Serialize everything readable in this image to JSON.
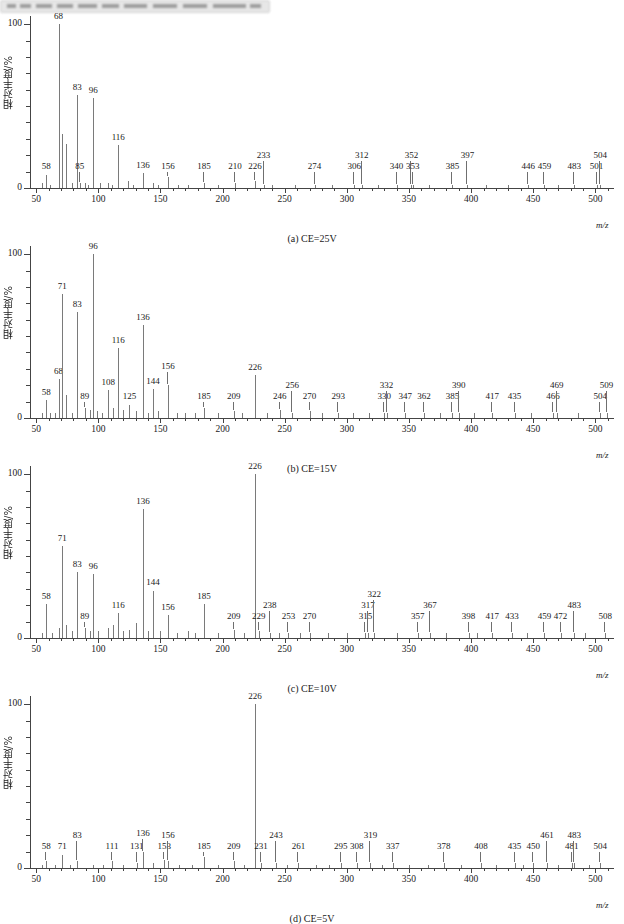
{
  "window": {
    "title_blurred": true
  },
  "figure": {
    "y_axis_title": "相对丰度/%",
    "x_axis_title": "m/z",
    "y_ticks": [
      0,
      100
    ],
    "x_ticks": [
      50,
      100,
      150,
      200,
      250,
      300,
      350,
      400,
      450,
      500
    ],
    "x_range": [
      45,
      515
    ],
    "y_range": [
      0,
      105
    ],
    "series_color": "#7a7a7a"
  },
  "chart_data": [
    {
      "type": "bar",
      "panel": "a",
      "title": "(a) CE=25V",
      "xlabel": "m/z",
      "ylabel": "相对丰度/%",
      "xlim": [
        45,
        515
      ],
      "ylim": [
        0,
        105
      ],
      "grid": false,
      "labeled_peaks": [
        {
          "mz": 58,
          "intensity": 8
        },
        {
          "mz": 68,
          "intensity": 100
        },
        {
          "mz": 83,
          "intensity": 57
        },
        {
          "mz": 85,
          "intensity": 3
        },
        {
          "mz": 96,
          "intensity": 55
        },
        {
          "mz": 116,
          "intensity": 26
        },
        {
          "mz": 136,
          "intensity": 9
        },
        {
          "mz": 156,
          "intensity": 7
        },
        {
          "mz": 185,
          "intensity": 3
        },
        {
          "mz": 210,
          "intensity": 3
        },
        {
          "mz": 226,
          "intensity": 4
        },
        {
          "mz": 233,
          "intensity": 2
        },
        {
          "mz": 274,
          "intensity": 2
        },
        {
          "mz": 306,
          "intensity": 2
        },
        {
          "mz": 312,
          "intensity": 2
        },
        {
          "mz": 340,
          "intensity": 2
        },
        {
          "mz": 352,
          "intensity": 2
        },
        {
          "mz": 353,
          "intensity": 2
        },
        {
          "mz": 385,
          "intensity": 2
        },
        {
          "mz": 397,
          "intensity": 2
        },
        {
          "mz": 446,
          "intensity": 2
        },
        {
          "mz": 459,
          "intensity": 2
        },
        {
          "mz": 483,
          "intensity": 2
        },
        {
          "mz": 501,
          "intensity": 2
        },
        {
          "mz": 504,
          "intensity": 2
        }
      ],
      "unlabeled_peaks": [
        {
          "mz": 71,
          "intensity": 33
        },
        {
          "mz": 74,
          "intensity": 27
        },
        {
          "mz": 55,
          "intensity": 3
        },
        {
          "mz": 61,
          "intensity": 2
        },
        {
          "mz": 79,
          "intensity": 3
        },
        {
          "mz": 89,
          "intensity": 3
        },
        {
          "mz": 92,
          "intensity": 2
        },
        {
          "mz": 101,
          "intensity": 3
        },
        {
          "mz": 108,
          "intensity": 3
        },
        {
          "mz": 111,
          "intensity": 2
        },
        {
          "mz": 124,
          "intensity": 4
        },
        {
          "mz": 128,
          "intensity": 2
        },
        {
          "mz": 144,
          "intensity": 3
        },
        {
          "mz": 148,
          "intensity": 2
        },
        {
          "mz": 164,
          "intensity": 2
        },
        {
          "mz": 172,
          "intensity": 2
        },
        {
          "mz": 196,
          "intensity": 2
        },
        {
          "mz": 240,
          "intensity": 2
        },
        {
          "mz": 258,
          "intensity": 2
        },
        {
          "mz": 288,
          "intensity": 2
        },
        {
          "mz": 325,
          "intensity": 2
        },
        {
          "mz": 366,
          "intensity": 2
        },
        {
          "mz": 412,
          "intensity": 2
        },
        {
          "mz": 430,
          "intensity": 2
        },
        {
          "mz": 470,
          "intensity": 2
        }
      ]
    },
    {
      "type": "bar",
      "panel": "b",
      "title": "(b) CE=15V",
      "xlabel": "m/z",
      "ylabel": "相对丰度/%",
      "xlim": [
        45,
        515
      ],
      "ylim": [
        0,
        105
      ],
      "grid": false,
      "labeled_peaks": [
        {
          "mz": 58,
          "intensity": 11
        },
        {
          "mz": 68,
          "intensity": 24
        },
        {
          "mz": 71,
          "intensity": 76
        },
        {
          "mz": 83,
          "intensity": 65
        },
        {
          "mz": 89,
          "intensity": 6
        },
        {
          "mz": 96,
          "intensity": 100
        },
        {
          "mz": 108,
          "intensity": 17
        },
        {
          "mz": 116,
          "intensity": 43
        },
        {
          "mz": 125,
          "intensity": 8
        },
        {
          "mz": 136,
          "intensity": 57
        },
        {
          "mz": 144,
          "intensity": 18
        },
        {
          "mz": 156,
          "intensity": 20
        },
        {
          "mz": 185,
          "intensity": 6
        },
        {
          "mz": 209,
          "intensity": 4
        },
        {
          "mz": 226,
          "intensity": 26
        },
        {
          "mz": 246,
          "intensity": 5
        },
        {
          "mz": 256,
          "intensity": 3
        },
        {
          "mz": 270,
          "intensity": 4
        },
        {
          "mz": 293,
          "intensity": 3
        },
        {
          "mz": 330,
          "intensity": 3
        },
        {
          "mz": 332,
          "intensity": 3
        },
        {
          "mz": 347,
          "intensity": 3
        },
        {
          "mz": 362,
          "intensity": 3
        },
        {
          "mz": 385,
          "intensity": 3
        },
        {
          "mz": 390,
          "intensity": 3
        },
        {
          "mz": 417,
          "intensity": 3
        },
        {
          "mz": 435,
          "intensity": 3
        },
        {
          "mz": 466,
          "intensity": 3
        },
        {
          "mz": 469,
          "intensity": 3
        },
        {
          "mz": 504,
          "intensity": 3
        },
        {
          "mz": 509,
          "intensity": 3
        }
      ],
      "unlabeled_peaks": [
        {
          "mz": 55,
          "intensity": 3
        },
        {
          "mz": 61,
          "intensity": 3
        },
        {
          "mz": 65,
          "intensity": 3
        },
        {
          "mz": 74,
          "intensity": 14
        },
        {
          "mz": 79,
          "intensity": 3
        },
        {
          "mz": 93,
          "intensity": 5
        },
        {
          "mz": 99,
          "intensity": 4
        },
        {
          "mz": 103,
          "intensity": 3
        },
        {
          "mz": 112,
          "intensity": 6
        },
        {
          "mz": 120,
          "intensity": 5
        },
        {
          "mz": 130,
          "intensity": 4
        },
        {
          "mz": 140,
          "intensity": 3
        },
        {
          "mz": 148,
          "intensity": 4
        },
        {
          "mz": 163,
          "intensity": 3
        },
        {
          "mz": 170,
          "intensity": 3
        },
        {
          "mz": 178,
          "intensity": 3
        },
        {
          "mz": 196,
          "intensity": 3
        },
        {
          "mz": 216,
          "intensity": 3
        },
        {
          "mz": 236,
          "intensity": 3
        },
        {
          "mz": 280,
          "intensity": 3
        },
        {
          "mz": 305,
          "intensity": 3
        },
        {
          "mz": 318,
          "intensity": 3
        },
        {
          "mz": 375,
          "intensity": 3
        },
        {
          "mz": 402,
          "intensity": 3
        },
        {
          "mz": 448,
          "intensity": 3
        },
        {
          "mz": 486,
          "intensity": 3
        }
      ]
    },
    {
      "type": "bar",
      "panel": "c",
      "title": "(c) CE=10V",
      "xlabel": "m/z",
      "ylabel": "相对丰度/%",
      "xlim": [
        45,
        515
      ],
      "ylim": [
        0,
        105
      ],
      "grid": false,
      "labeled_peaks": [
        {
          "mz": 58,
          "intensity": 21
        },
        {
          "mz": 71,
          "intensity": 56
        },
        {
          "mz": 83,
          "intensity": 40
        },
        {
          "mz": 89,
          "intensity": 6
        },
        {
          "mz": 96,
          "intensity": 39
        },
        {
          "mz": 116,
          "intensity": 15
        },
        {
          "mz": 136,
          "intensity": 79
        },
        {
          "mz": 144,
          "intensity": 29
        },
        {
          "mz": 156,
          "intensity": 14
        },
        {
          "mz": 185,
          "intensity": 21
        },
        {
          "mz": 209,
          "intensity": 5
        },
        {
          "mz": 226,
          "intensity": 100
        },
        {
          "mz": 229,
          "intensity": 4
        },
        {
          "mz": 238,
          "intensity": 3
        },
        {
          "mz": 253,
          "intensity": 3
        },
        {
          "mz": 270,
          "intensity": 3
        },
        {
          "mz": 315,
          "intensity": 3
        },
        {
          "mz": 317,
          "intensity": 3
        },
        {
          "mz": 322,
          "intensity": 3
        },
        {
          "mz": 357,
          "intensity": 3
        },
        {
          "mz": 367,
          "intensity": 3
        },
        {
          "mz": 398,
          "intensity": 3
        },
        {
          "mz": 417,
          "intensity": 3
        },
        {
          "mz": 433,
          "intensity": 3
        },
        {
          "mz": 459,
          "intensity": 3
        },
        {
          "mz": 472,
          "intensity": 3
        },
        {
          "mz": 483,
          "intensity": 3
        },
        {
          "mz": 508,
          "intensity": 3
        }
      ],
      "unlabeled_peaks": [
        {
          "mz": 55,
          "intensity": 3
        },
        {
          "mz": 63,
          "intensity": 3
        },
        {
          "mz": 68,
          "intensity": 6
        },
        {
          "mz": 74,
          "intensity": 8
        },
        {
          "mz": 79,
          "intensity": 4
        },
        {
          "mz": 93,
          "intensity": 4
        },
        {
          "mz": 100,
          "intensity": 4
        },
        {
          "mz": 108,
          "intensity": 6
        },
        {
          "mz": 112,
          "intensity": 8
        },
        {
          "mz": 120,
          "intensity": 4
        },
        {
          "mz": 125,
          "intensity": 5
        },
        {
          "mz": 130,
          "intensity": 9
        },
        {
          "mz": 140,
          "intensity": 4
        },
        {
          "mz": 150,
          "intensity": 4
        },
        {
          "mz": 163,
          "intensity": 3
        },
        {
          "mz": 172,
          "intensity": 4
        },
        {
          "mz": 178,
          "intensity": 3
        },
        {
          "mz": 196,
          "intensity": 3
        },
        {
          "mz": 217,
          "intensity": 3
        },
        {
          "mz": 245,
          "intensity": 3
        },
        {
          "mz": 262,
          "intensity": 3
        },
        {
          "mz": 285,
          "intensity": 3
        },
        {
          "mz": 300,
          "intensity": 3
        },
        {
          "mz": 340,
          "intensity": 3
        },
        {
          "mz": 380,
          "intensity": 3
        },
        {
          "mz": 405,
          "intensity": 3
        },
        {
          "mz": 445,
          "intensity": 3
        },
        {
          "mz": 492,
          "intensity": 3
        }
      ]
    },
    {
      "type": "bar",
      "panel": "d",
      "title": "(d) CE=5V",
      "xlabel": "m/z",
      "ylabel": "相对丰度/%",
      "xlim": [
        45,
        515
      ],
      "ylim": [
        0,
        105
      ],
      "grid": false,
      "labeled_peaks": [
        {
          "mz": 58,
          "intensity": 4
        },
        {
          "mz": 71,
          "intensity": 8
        },
        {
          "mz": 83,
          "intensity": 4
        },
        {
          "mz": 111,
          "intensity": 4
        },
        {
          "mz": 131,
          "intensity": 3
        },
        {
          "mz": 136,
          "intensity": 10
        },
        {
          "mz": 153,
          "intensity": 5
        },
        {
          "mz": 156,
          "intensity": 4
        },
        {
          "mz": 185,
          "intensity": 7
        },
        {
          "mz": 209,
          "intensity": 4
        },
        {
          "mz": 226,
          "intensity": 100
        },
        {
          "mz": 231,
          "intensity": 3
        },
        {
          "mz": 243,
          "intensity": 3
        },
        {
          "mz": 261,
          "intensity": 3
        },
        {
          "mz": 295,
          "intensity": 3
        },
        {
          "mz": 308,
          "intensity": 3
        },
        {
          "mz": 319,
          "intensity": 3
        },
        {
          "mz": 337,
          "intensity": 3
        },
        {
          "mz": 378,
          "intensity": 3
        },
        {
          "mz": 408,
          "intensity": 3
        },
        {
          "mz": 435,
          "intensity": 3
        },
        {
          "mz": 450,
          "intensity": 3
        },
        {
          "mz": 461,
          "intensity": 3
        },
        {
          "mz": 481,
          "intensity": 3
        },
        {
          "mz": 483,
          "intensity": 3
        },
        {
          "mz": 504,
          "intensity": 3
        }
      ],
      "unlabeled_peaks": [
        {
          "mz": 55,
          "intensity": 2
        },
        {
          "mz": 65,
          "intensity": 2
        },
        {
          "mz": 77,
          "intensity": 2
        },
        {
          "mz": 96,
          "intensity": 2
        },
        {
          "mz": 104,
          "intensity": 2
        },
        {
          "mz": 120,
          "intensity": 2
        },
        {
          "mz": 144,
          "intensity": 3
        },
        {
          "mz": 165,
          "intensity": 2
        },
        {
          "mz": 175,
          "intensity": 2
        },
        {
          "mz": 196,
          "intensity": 2
        },
        {
          "mz": 217,
          "intensity": 2
        },
        {
          "mz": 252,
          "intensity": 2
        },
        {
          "mz": 275,
          "intensity": 2
        },
        {
          "mz": 286,
          "intensity": 2
        },
        {
          "mz": 328,
          "intensity": 2
        },
        {
          "mz": 350,
          "intensity": 2
        },
        {
          "mz": 365,
          "intensity": 2
        },
        {
          "mz": 392,
          "intensity": 2
        },
        {
          "mz": 420,
          "intensity": 2
        },
        {
          "mz": 442,
          "intensity": 2
        },
        {
          "mz": 470,
          "intensity": 2
        },
        {
          "mz": 495,
          "intensity": 2
        }
      ]
    }
  ]
}
